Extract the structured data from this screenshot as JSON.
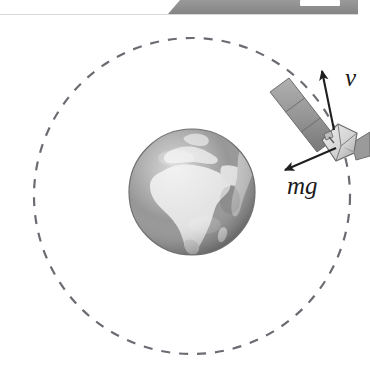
{
  "figure": {
    "caption": "",
    "background_color": "#ffffff"
  },
  "top_banner": {
    "name": "cropped-graphic-strip",
    "description": "partial gray graphic bar cropped at top edge",
    "fill_color": "#8f8f8f",
    "notch_color": "#ffffff"
  },
  "orbit": {
    "label": "orbit-path",
    "style": "dashed",
    "center_x": 192,
    "center_y": 196,
    "radius": 158,
    "stroke_color": "#6b6b72",
    "stroke_width": 2.2,
    "dash_pattern": "9 9"
  },
  "earth": {
    "label": "Earth",
    "center_x": 192,
    "center_y": 192,
    "radius": 63,
    "ocean_color": "#8d8d8d",
    "land_color": "#e2e2e2",
    "shadow_color": "#6e6e6e",
    "highlight_color": "#f2f2f2",
    "visible_region": "Africa, Europe, Middle East"
  },
  "satellite": {
    "label": "satellite",
    "body_center_x": 339,
    "body_center_y": 140,
    "body_color": "#dcdcdc",
    "body_shade_color": "#a8a8a8",
    "panel_color": "#9a9a9a",
    "panel_dark_color": "#7d7d7d",
    "panel_segments": 3
  },
  "vectors": [
    {
      "id": "velocity",
      "label": "v",
      "meaning": "orbital velocity, tangent to orbit",
      "tail_x": 334,
      "tail_y": 130,
      "head_x": 322,
      "head_y": 71,
      "label_x": 345,
      "label_y": 86,
      "color": "#1f1f1f"
    },
    {
      "id": "weight",
      "label": "mg",
      "meaning": "gravitational force toward Earth's centre",
      "tail_x": 336,
      "tail_y": 148,
      "head_x": 285,
      "head_y": 170,
      "label_x": 287,
      "label_y": 194,
      "color": "#1f1f1f"
    }
  ]
}
